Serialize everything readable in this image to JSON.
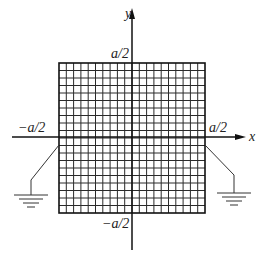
{
  "diagram": {
    "type": "square-grid-plate-with-grounds",
    "grid": {
      "divisions_x": 20,
      "divisions_y": 20,
      "left": 59,
      "top": 63,
      "right": 205,
      "bottom": 213,
      "line_color": "#2a2a2a",
      "border_color": "#111111"
    },
    "axes": {
      "origin_x": 132,
      "origin_y": 137,
      "x_axis": {
        "from": 12,
        "to": 246,
        "label": "x"
      },
      "y_axis": {
        "from": 250,
        "to": 8,
        "label": "y"
      }
    },
    "labels": {
      "top": "a/2",
      "bottom": "−a/2",
      "left": "−a/2",
      "right": "a/2",
      "x_axis": "x",
      "y_axis": "y"
    },
    "grounds": [
      {
        "side": "left",
        "attach": [
          59,
          145
        ],
        "elbow": [
          31,
          180
        ],
        "base_x": 31,
        "base_y": 195
      },
      {
        "side": "right",
        "attach": [
          205,
          145
        ],
        "elbow": [
          234,
          175
        ],
        "base_x": 234,
        "base_y": 193
      }
    ]
  }
}
